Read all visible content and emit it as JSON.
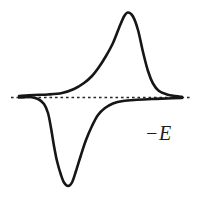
{
  "figure": {
    "background": "#ffffff",
    "axis_label": "−E"
  },
  "chart_data": {
    "type": "line",
    "title": "",
    "xlabel": "−E",
    "ylabel": "",
    "grid": false,
    "axes_visible": false,
    "legend": null,
    "line_color": "#161616",
    "line_width": 2.6,
    "baseline_color": "#262626",
    "baseline": {
      "style": "dashed",
      "y": 97.5,
      "x1": 11,
      "x2": 192,
      "dash": "2.6 2.9",
      "width": 1.3
    },
    "series": [
      {
        "name": "anodic-peak-branch",
        "points": [
          [
            19,
            96
          ],
          [
            34,
            95
          ],
          [
            48,
            94.5
          ],
          [
            62,
            93
          ],
          [
            74,
            89
          ],
          [
            84,
            83
          ],
          [
            92,
            76
          ],
          [
            99,
            67
          ],
          [
            106,
            56
          ],
          [
            113,
            43
          ],
          [
            119,
            28
          ],
          [
            124,
            16.5
          ],
          [
            128,
            12.5
          ],
          [
            133,
            16.5
          ],
          [
            138,
            30
          ],
          [
            143,
            52
          ],
          [
            148,
            71
          ],
          [
            153,
            83.5
          ],
          [
            159,
            91
          ],
          [
            167,
            94.5
          ],
          [
            175,
            96
          ],
          [
            182,
            96.8
          ]
        ]
      },
      {
        "name": "cathodic-peak-branch",
        "points": [
          [
            19,
            97.5
          ],
          [
            30,
            97
          ],
          [
            38,
            99
          ],
          [
            44,
            104
          ],
          [
            48,
            113
          ],
          [
            51,
            128
          ],
          [
            54,
            146
          ],
          [
            57,
            161
          ],
          [
            61,
            175
          ],
          [
            64,
            182.5
          ],
          [
            68,
            186
          ],
          [
            72,
            182.5
          ],
          [
            76,
            171
          ],
          [
            81,
            155
          ],
          [
            86,
            140
          ],
          [
            92,
            126
          ],
          [
            98,
            115
          ],
          [
            105,
            108
          ],
          [
            113,
            103.5
          ],
          [
            123,
            101
          ],
          [
            137,
            99.8
          ],
          [
            152,
            99
          ],
          [
            167,
            98.5
          ],
          [
            182,
            98
          ]
        ]
      }
    ]
  }
}
